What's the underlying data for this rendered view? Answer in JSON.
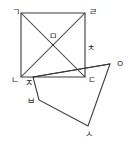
{
  "figure": {
    "stroke_color": "#3a3a3a",
    "background_color": "#ffffff",
    "label_color": "#2b2b2b"
  },
  "points": {
    "giyeok": {
      "label": "ㄱ",
      "x": 21,
      "y": 13,
      "label_x": 12,
      "label_y": 8
    },
    "rieul": {
      "label": "ㄹ",
      "x": 85,
      "y": 13,
      "label_x": 89,
      "label_y": 8
    },
    "nieun": {
      "label": "ㄴ",
      "x": 21,
      "y": 77,
      "label_x": 11,
      "label_y": 76
    },
    "digeut": {
      "label": "ㄷ",
      "x": 85,
      "y": 77,
      "label_x": 88,
      "label_y": 76
    },
    "mieum": {
      "label": "ㅁ",
      "x": 53,
      "y": 45,
      "label_x": 49,
      "label_y": 32
    },
    "jieut": {
      "label": "ㅈ",
      "x": 33,
      "y": 77,
      "label_x": 25,
      "label_y": 79
    },
    "chieut": {
      "label": "ㅊ",
      "x": 85,
      "y": 53,
      "label_x": 87,
      "label_y": 44
    },
    "ieung": {
      "label": "ㅇ",
      "x": 110,
      "y": 64,
      "label_x": 116,
      "label_y": 60
    },
    "bieup": {
      "label": "ㅂ",
      "x": 39,
      "y": 100,
      "label_x": 27,
      "label_y": 97
    },
    "siot": {
      "label": "ㅅ",
      "x": 88,
      "y": 126,
      "label_x": 85,
      "label_y": 130
    }
  },
  "shapes": {
    "outer_square": {
      "name": "square-rieul-giyeok-nieun-digeut",
      "vertex_order": [
        "giyeok",
        "rieul",
        "digeut",
        "nieun"
      ]
    },
    "tilted_square": {
      "name": "tilted-square-jieut-ieung-siot-bieup",
      "vertex_order": [
        "jieut",
        "ieung",
        "siot",
        "bieup"
      ]
    },
    "diagonals": [
      {
        "name": "diagonal-giyeok-digeut",
        "from": "giyeok",
        "to": "digeut"
      },
      {
        "name": "diagonal-rieul-nieun",
        "from": "rieul",
        "to": "nieun"
      }
    ],
    "segments": [
      {
        "name": "segment-jieut-chieut-ieung",
        "from": "jieut",
        "to": "ieung"
      }
    ]
  }
}
